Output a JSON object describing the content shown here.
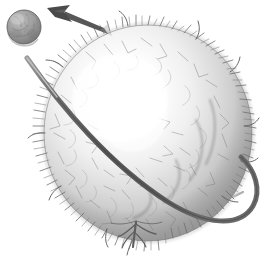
{
  "figure": {
    "title": "Fuzzy sphere with orbital ring and ejected small sphere",
    "background_color": "#ffffff",
    "width": 268,
    "height": 263
  },
  "objects": {
    "main_sphere": {
      "name": "large textured sphere",
      "center_x": 148,
      "center_y": 133,
      "radius_x": 104,
      "radius_y": 108,
      "fill_light": "#ffffff",
      "fill_mid": "#b9b9b9",
      "fill_dark": "#8b8b8b",
      "rim_color": "#6e6e6e",
      "highlight_x": 118,
      "highlight_y": 96,
      "surface": "hairy-spiky",
      "hair_count": 260,
      "hair_color": "#6b6b6b"
    },
    "small_sphere": {
      "name": "small sphere",
      "center_x": 24,
      "center_y": 27,
      "radius": 17,
      "fill_light": "#b4b4b4",
      "fill_mid": "#8e8e8e",
      "fill_dark": "#6a6a6a",
      "edge_color": "#5d5d5d",
      "mottle_color": "#7c7c7c"
    },
    "arrow": {
      "name": "motion arrow",
      "color": "#4a4a4a",
      "tip_x": 47,
      "tip_y": 8,
      "tail_x": 108,
      "tail_y": 33,
      "direction": "up-left",
      "meaning": "ejection / departure direction"
    },
    "orbit_ring": {
      "name": "orbital ring",
      "color_front": "#5b5b5b",
      "color_back": "#6f6f6f",
      "thickness_front": 5,
      "thickness_back": 2,
      "left_tip_x": 26,
      "left_tip_y": 58,
      "right_extent_x": 259,
      "bottom_y": 226,
      "tilt_degrees": -28
    },
    "tendril": {
      "name": "bottom tendril",
      "root_x": 136,
      "root_y": 222,
      "tip_y": 247,
      "color": "#5e5e5e",
      "branch_count": 6
    }
  },
  "palette": {
    "white": "#ffffff",
    "light_gray": "#dcdcdc",
    "mid_gray": "#a8a8a8",
    "dark_gray": "#6b6b6b",
    "charcoal": "#4a4a4a"
  },
  "labels": {
    "figure_caption": "",
    "small_sphere_label": "",
    "main_sphere_label": ""
  }
}
